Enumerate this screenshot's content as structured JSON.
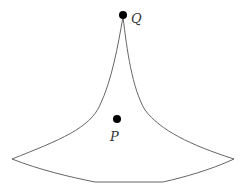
{
  "diagram": {
    "points": [
      {
        "id": "Q",
        "label": "Q"
      },
      {
        "id": "P",
        "label": "P"
      }
    ],
    "colors": {
      "outline": "#666666",
      "point": "#000000",
      "label": "#333333"
    }
  }
}
